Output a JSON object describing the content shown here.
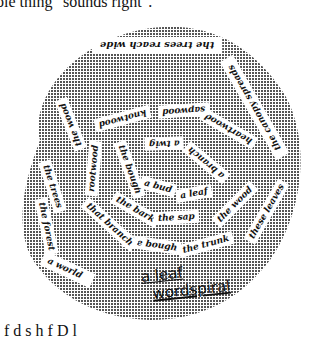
{
  "text": {
    "top_line": "ole thing \"sounds right\".",
    "bottom_line": "f    d         s    h          f      D      l"
  },
  "figure": {
    "title_line1": "a leaf",
    "title_line2": "wordspiral",
    "fill_color": "#888888",
    "strips": [
      {
        "label": "the trees reach wide"
      },
      {
        "label": "the canopy spreads"
      },
      {
        "label": "heartwood"
      },
      {
        "label": "sapwood"
      },
      {
        "label": "knotwood"
      },
      {
        "label": "the wood"
      },
      {
        "label": "rootwood"
      },
      {
        "label": "a twig"
      },
      {
        "label": "a branch"
      },
      {
        "label": "the bough"
      },
      {
        "label": "a bud"
      },
      {
        "label": "a leaf"
      },
      {
        "label": "the bark"
      },
      {
        "label": "the sap"
      },
      {
        "label": "the wood"
      },
      {
        "label": "these leaves"
      },
      {
        "label": "the trunk"
      },
      {
        "label": "the bough"
      },
      {
        "label": "that branch"
      },
      {
        "label": "the trees"
      },
      {
        "label": "the forest"
      },
      {
        "label": "a world"
      }
    ]
  }
}
